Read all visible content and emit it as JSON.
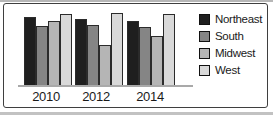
{
  "figure": {
    "background": "#ffffff",
    "frame_border_color": "#3f3f3f"
  },
  "chart_data": {
    "type": "bar",
    "title": "",
    "xlabel": "",
    "ylabel": "",
    "categories": [
      "2010",
      "2012",
      "2014"
    ],
    "series": [
      {
        "name": "Northeast",
        "color": "#1f1f1f",
        "values": [
          70,
          68,
          66
        ]
      },
      {
        "name": "South",
        "color": "#858585",
        "values": [
          61,
          62,
          60
        ]
      },
      {
        "name": "Midwest",
        "color": "#b5b5b5",
        "values": [
          66,
          42,
          51
        ]
      },
      {
        "name": "West",
        "color": "#d9d9d9",
        "values": [
          73,
          74,
          73
        ]
      }
    ],
    "ylim": [
      0,
      80
    ],
    "grid": false,
    "legend_position": "right",
    "axis_line_color": "#a9a9a9",
    "bar_outline_color": "#2b2b2b",
    "label_color": "#1a1a1a"
  }
}
